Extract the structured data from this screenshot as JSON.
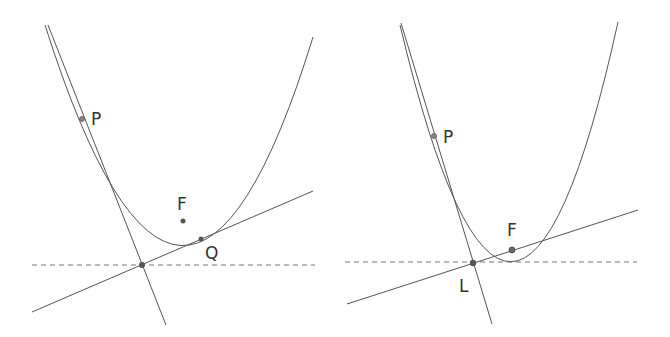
{
  "figure": {
    "colors": {
      "curve": "#555555",
      "line": "#555555",
      "dashed": "#777777",
      "point": "#555555",
      "label": "#333333",
      "background": "#ffffff"
    },
    "left_panel": {
      "labels": {
        "P": "P",
        "F": "F",
        "Q": "Q"
      },
      "parabola_path": "M 45 25 Q 183 460 313 37",
      "points": {
        "P": [
          82,
          119
        ],
        "F": [
          183,
          221
        ],
        "Q": [
          201,
          239
        ],
        "intersection": [
          142,
          265
        ]
      },
      "directrix": {
        "x1": 32,
        "y1": 265,
        "x2": 315,
        "y2": 265
      },
      "line_through_Q": {
        "x1": 32,
        "y1": 312,
        "x2": 313,
        "y2": 191
      },
      "tangent_at_P": {
        "x1": 48,
        "y1": 25,
        "x2": 166,
        "y2": 325
      }
    },
    "right_panel": {
      "labels": {
        "P": "P",
        "F": "F",
        "L": "L"
      },
      "parabola_path": "M 400 25 Q 513 500 618 22",
      "points": {
        "P": [
          434,
          136
        ],
        "F": [
          512,
          250
        ],
        "L": [
          473,
          263
        ]
      },
      "directrix": {
        "x1": 345,
        "y1": 262,
        "x2": 637,
        "y2": 262
      },
      "line_through_F": {
        "x1": 347,
        "y1": 304,
        "x2": 638,
        "y2": 210
      },
      "tangent_at_P": {
        "x1": 401,
        "y1": 23,
        "x2": 492,
        "y2": 324
      }
    }
  }
}
